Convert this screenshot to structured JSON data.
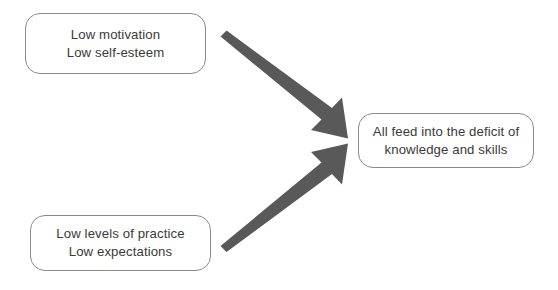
{
  "diagram": {
    "title": "All feed into the deficit of knowledge and skills",
    "background_color": "#ffffff",
    "box_border_color": "#8a8a8a",
    "box_fill_color": "#ffffff",
    "text_color": "#3a3a3a",
    "arrow_color": "#595959",
    "nodes": [
      {
        "id": "low-motivation",
        "lines": [
          "Low motivation",
          "Low self-esteem"
        ],
        "line1": "Low motivation",
        "line2": "Low self-esteem",
        "position": "top-left"
      },
      {
        "id": "low-practice",
        "lines": [
          "Low levels of practice",
          "Low expectations"
        ],
        "line1": "Low levels of practice",
        "line2": "Low expectations",
        "position": "bottom-left"
      },
      {
        "id": "deficit",
        "lines": [
          "All feed into the deficit of",
          "knowledge and skills"
        ],
        "line1": "All feed into the deficit of",
        "line2": "knowledge and skills",
        "position": "right"
      }
    ],
    "arrows": [
      {
        "id": "arrow-top-to-deficit",
        "from": "low-motivation",
        "to": "deficit",
        "direction": "down-right",
        "label": ""
      },
      {
        "id": "arrow-bottom-to-deficit",
        "from": "low-practice",
        "to": "deficit",
        "direction": "up-right",
        "label": ""
      }
    ]
  }
}
